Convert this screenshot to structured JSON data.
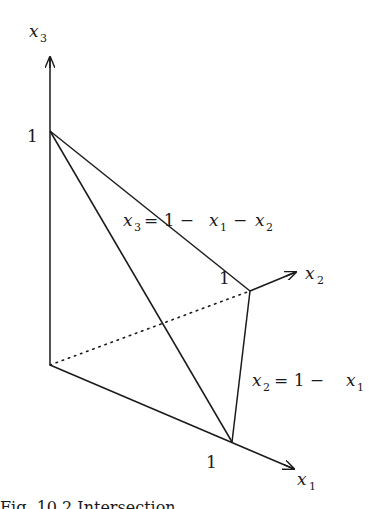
{
  "figure": {
    "axes": {
      "x1": {
        "var": "x",
        "sub": "1",
        "tick": "1"
      },
      "x2": {
        "var": "x",
        "sub": "2",
        "tick": "1"
      },
      "x3": {
        "var": "x",
        "sub": "3",
        "tick": "1"
      }
    },
    "equations": {
      "plane": {
        "lhs_var": "x",
        "lhs_sub": "3",
        "rhs_a": "= 1 −",
        "t1_var": "x",
        "t1_sub": "1",
        "rhs_b": "−",
        "t2_var": "x",
        "t2_sub": "2"
      },
      "line": {
        "lhs_var": "x",
        "lhs_sub": "2",
        "rhs_a": "= 1 −",
        "t1_var": "x",
        "t1_sub": "1"
      }
    },
    "caption_partial": "Fig. 10.2 Intersection ..."
  }
}
